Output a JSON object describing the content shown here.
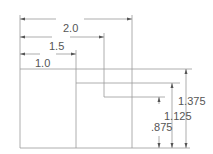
{
  "diagram": {
    "type": "dimensioned-drawing",
    "stroke_color": "#9a9a9a",
    "text_color": "#555555",
    "horizontal_dimensions": [
      {
        "label": "2.0",
        "value": 2.0
      },
      {
        "label": "1.5",
        "value": 1.5
      },
      {
        "label": "1.0",
        "value": 1.0
      }
    ],
    "vertical_dimensions": [
      {
        "label": "1.375",
        "value": 1.375
      },
      {
        "label": "1.125",
        "value": 1.125
      },
      {
        "label": ".875",
        "value": 0.875
      }
    ]
  }
}
